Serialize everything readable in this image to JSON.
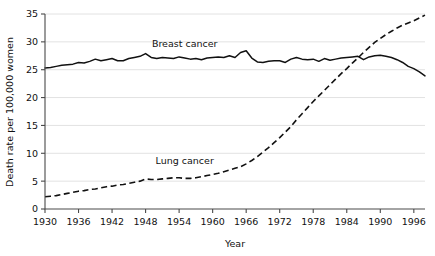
{
  "chart_data": {
    "type": "line",
    "title": "",
    "xlabel": "Year",
    "ylabel": "Death rate per 100,000 women",
    "xlim": [
      1930,
      1998
    ],
    "ylim": [
      0,
      35
    ],
    "grid": true,
    "legend_position": "inline-annotation",
    "xticks": [
      1930,
      1936,
      1942,
      1948,
      1954,
      1960,
      1966,
      1972,
      1978,
      1984,
      1990,
      1996
    ],
    "yticks": [
      0,
      5,
      10,
      15,
      20,
      25,
      30,
      35
    ],
    "x": [
      1930,
      1931,
      1932,
      1933,
      1934,
      1935,
      1936,
      1937,
      1938,
      1939,
      1940,
      1941,
      1942,
      1943,
      1944,
      1945,
      1946,
      1947,
      1948,
      1949,
      1950,
      1951,
      1952,
      1953,
      1954,
      1955,
      1956,
      1957,
      1958,
      1959,
      1960,
      1961,
      1962,
      1963,
      1964,
      1965,
      1966,
      1967,
      1968,
      1969,
      1970,
      1971,
      1972,
      1973,
      1974,
      1975,
      1976,
      1977,
      1978,
      1979,
      1980,
      1981,
      1982,
      1983,
      1984,
      1985,
      1986,
      1987,
      1988,
      1989,
      1990,
      1991,
      1992,
      1993,
      1994,
      1995,
      1996,
      1997,
      1998
    ],
    "series": [
      {
        "name": "Breast cancer",
        "style": "solid",
        "label_x": 1955,
        "label_y": 29.0,
        "values": [
          25.3,
          25.4,
          25.6,
          25.8,
          25.9,
          26.0,
          26.3,
          26.2,
          26.5,
          26.9,
          26.6,
          26.8,
          27.0,
          26.6,
          26.6,
          27.0,
          27.2,
          27.4,
          27.9,
          27.2,
          27.0,
          27.2,
          27.1,
          27.0,
          27.3,
          27.1,
          26.9,
          27.0,
          26.8,
          27.1,
          27.2,
          27.3,
          27.2,
          27.5,
          27.2,
          28.1,
          28.4,
          27.1,
          26.4,
          26.3,
          26.5,
          26.6,
          26.6,
          26.3,
          26.9,
          27.2,
          26.9,
          26.8,
          26.9,
          26.5,
          27.0,
          26.7,
          26.9,
          27.1,
          27.2,
          27.3,
          27.4,
          26.8,
          27.3,
          27.5,
          27.6,
          27.4,
          27.2,
          26.8,
          26.3,
          25.6,
          25.2,
          24.6,
          23.9
        ]
      },
      {
        "name": "Lung cancer",
        "style": "dashed",
        "label_x": 1955,
        "label_y": 8.0,
        "values": [
          2.2,
          2.3,
          2.4,
          2.6,
          2.8,
          3.0,
          3.2,
          3.3,
          3.5,
          3.6,
          3.8,
          4.0,
          4.1,
          4.3,
          4.4,
          4.6,
          4.8,
          5.0,
          5.4,
          5.3,
          5.3,
          5.4,
          5.5,
          5.6,
          5.6,
          5.5,
          5.5,
          5.6,
          5.8,
          6.0,
          6.2,
          6.4,
          6.7,
          7.0,
          7.3,
          7.6,
          8.1,
          8.7,
          9.4,
          10.2,
          11.0,
          11.9,
          12.8,
          13.8,
          14.8,
          16.0,
          17.1,
          18.2,
          19.3,
          20.3,
          21.3,
          22.3,
          23.3,
          24.3,
          25.2,
          26.2,
          27.1,
          28.1,
          29.0,
          29.9,
          30.6,
          31.3,
          31.9,
          32.5,
          33.0,
          33.4,
          33.8,
          34.3,
          34.8
        ]
      }
    ]
  },
  "layout": {
    "plot_left": 45,
    "plot_right": 425,
    "plot_top": 14,
    "plot_bottom": 209
  }
}
